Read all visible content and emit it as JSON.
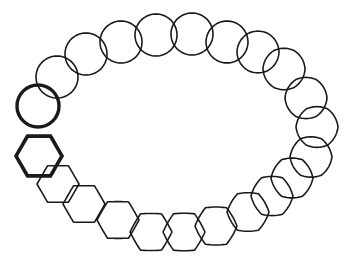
{
  "diagram": {
    "stroke_color": "#1a1a1a",
    "background": "#ffffff",
    "start_circle": {
      "cx": 38,
      "cy": 106,
      "r": 21,
      "bold": true
    },
    "start_hexagon": {
      "cx": 39,
      "cy": 156,
      "r": 23,
      "bold": true
    },
    "shapes": [
      {
        "cx": 57,
        "cy": 77,
        "r": 21,
        "roundness": 1.0
      },
      {
        "cx": 86,
        "cy": 54,
        "r": 21,
        "roundness": 1.0
      },
      {
        "cx": 121,
        "cy": 42,
        "r": 21,
        "roundness": 1.0
      },
      {
        "cx": 156,
        "cy": 35,
        "r": 21,
        "roundness": 1.0
      },
      {
        "cx": 192,
        "cy": 34,
        "r": 21,
        "roundness": 1.0
      },
      {
        "cx": 227,
        "cy": 42,
        "r": 21,
        "roundness": 0.97
      },
      {
        "cx": 258,
        "cy": 52,
        "r": 21,
        "roundness": 0.94
      },
      {
        "cx": 284,
        "cy": 69,
        "r": 21,
        "roundness": 0.9
      },
      {
        "cx": 306,
        "cy": 98,
        "r": 21,
        "roundness": 0.85
      },
      {
        "cx": 317,
        "cy": 127,
        "r": 21,
        "roundness": 0.78
      },
      {
        "cx": 311,
        "cy": 157,
        "r": 21,
        "roundness": 0.7
      },
      {
        "cx": 292,
        "cy": 178,
        "r": 21,
        "roundness": 0.6
      },
      {
        "cx": 272,
        "cy": 196,
        "r": 21,
        "roundness": 0.5
      },
      {
        "cx": 248,
        "cy": 212,
        "r": 21,
        "roundness": 0.4
      },
      {
        "cx": 216,
        "cy": 226,
        "r": 21,
        "roundness": 0.3
      },
      {
        "cx": 184,
        "cy": 232,
        "r": 21,
        "roundness": 0.2
      },
      {
        "cx": 151,
        "cy": 232,
        "r": 21,
        "roundness": 0.12
      },
      {
        "cx": 118,
        "cy": 220,
        "r": 21,
        "roundness": 0.06
      },
      {
        "cx": 84,
        "cy": 204,
        "r": 21,
        "roundness": 0.02
      },
      {
        "cx": 58,
        "cy": 184,
        "r": 21,
        "roundness": 0.0
      }
    ]
  }
}
